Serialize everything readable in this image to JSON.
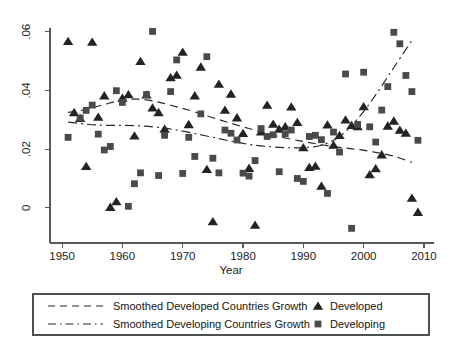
{
  "chart_data": {
    "type": "scatter",
    "title": "",
    "xlabel": "Year",
    "ylabel": "",
    "xlim": [
      1948,
      2011
    ],
    "ylim": [
      -0.012,
      0.064
    ],
    "xticks": [
      1950,
      1960,
      1970,
      1980,
      1990,
      2000,
      2010
    ],
    "xtick_labels": [
      "1950",
      "1960",
      "1970",
      "1980",
      "1990",
      "2000",
      "2010"
    ],
    "yticks": [
      0,
      0.02,
      0.04,
      0.06
    ],
    "ytick_labels": [
      "0",
      ".02",
      ".04",
      ".06"
    ],
    "grid": false,
    "legend_position": "below-axes",
    "series": [
      {
        "name": "Developed",
        "marker": "triangle",
        "color": "#232323",
        "points": [
          [
            1951,
            0.0567
          ],
          [
            1952,
            0.0325
          ],
          [
            1953,
            0.0305
          ],
          [
            1954,
            0.0141
          ],
          [
            1955,
            0.0565
          ],
          [
            1956,
            0.0309
          ],
          [
            1957,
            0.0382
          ],
          [
            1958,
            0.0002
          ],
          [
            1959,
            0.0021
          ],
          [
            1960,
            0.0374
          ],
          [
            1961,
            0.0386
          ],
          [
            1962,
            0.0245
          ],
          [
            1963,
            0.0499
          ],
          [
            1964,
            0.0385
          ],
          [
            1965,
            0.0341
          ],
          [
            1966,
            0.0325
          ],
          [
            1967,
            0.0268
          ],
          [
            1968,
            0.0444
          ],
          [
            1969,
            0.0452
          ],
          [
            1970,
            0.0531
          ],
          [
            1971,
            0.0284
          ],
          [
            1972,
            0.0382
          ],
          [
            1973,
            0.048
          ],
          [
            1974,
            0.0131
          ],
          [
            1975,
            -0.0047
          ],
          [
            1976,
            0.0422
          ],
          [
            1977,
            0.0333
          ],
          [
            1978,
            0.0388
          ],
          [
            1979,
            0.0307
          ],
          [
            1980,
            0.0254
          ],
          [
            1981,
            0.0135
          ],
          [
            1982,
            -0.0059
          ],
          [
            1983,
            0.0259
          ],
          [
            1984,
            0.035
          ],
          [
            1985,
            0.0285
          ],
          [
            1986,
            0.0268
          ],
          [
            1987,
            0.0277
          ],
          [
            1988,
            0.0344
          ],
          [
            1989,
            0.0291
          ],
          [
            1990,
            0.0205
          ],
          [
            1991,
            0.0138
          ],
          [
            1992,
            0.0142
          ],
          [
            1993,
            0.0074
          ],
          [
            1994,
            0.0283
          ],
          [
            1995,
            0.0214
          ],
          [
            1996,
            0.0247
          ],
          [
            1997,
            0.03
          ],
          [
            1998,
            0.0281
          ],
          [
            1999,
            0.0277
          ],
          [
            2000,
            0.0345
          ],
          [
            2001,
            0.0113
          ],
          [
            2002,
            0.0134
          ],
          [
            2003,
            0.0181
          ],
          [
            2004,
            0.0279
          ],
          [
            2005,
            0.0296
          ],
          [
            2006,
            0.0265
          ],
          [
            2007,
            0.0255
          ],
          [
            2008,
            0.0033
          ],
          [
            2009,
            -0.0015
          ]
        ]
      },
      {
        "name": "Developing",
        "marker": "square",
        "color": "#4a4a4a",
        "points": [
          [
            1951,
            0.024
          ],
          [
            1953,
            0.0306
          ],
          [
            1954,
            0.0332
          ],
          [
            1955,
            0.035
          ],
          [
            1956,
            0.0251
          ],
          [
            1957,
            0.0197
          ],
          [
            1958,
            0.0209
          ],
          [
            1959,
            0.0399
          ],
          [
            1960,
            0.0359
          ],
          [
            1961,
            0.0005
          ],
          [
            1962,
            0.0082
          ],
          [
            1963,
            0.0119
          ],
          [
            1964,
            0.0386
          ],
          [
            1965,
            0.0601
          ],
          [
            1966,
            0.011
          ],
          [
            1967,
            0.0247
          ],
          [
            1968,
            0.0396
          ],
          [
            1969,
            0.0504
          ],
          [
            1970,
            0.0117
          ],
          [
            1971,
            0.024
          ],
          [
            1972,
            0.0175
          ],
          [
            1973,
            0.032
          ],
          [
            1974,
            0.0515
          ],
          [
            1975,
            0.0169
          ],
          [
            1976,
            0.0119
          ],
          [
            1977,
            0.0265
          ],
          [
            1978,
            0.0254
          ],
          [
            1979,
            0.0231
          ],
          [
            1980,
            0.0118
          ],
          [
            1981,
            0.0108
          ],
          [
            1982,
            0.0161
          ],
          [
            1983,
            0.027
          ],
          [
            1984,
            0.0243
          ],
          [
            1985,
            0.0249
          ],
          [
            1986,
            0.0123
          ],
          [
            1987,
            0.0252
          ],
          [
            1988,
            0.0265
          ],
          [
            1989,
            0.01
          ],
          [
            1990,
            0.009
          ],
          [
            1991,
            0.0243
          ],
          [
            1992,
            0.0247
          ],
          [
            1993,
            0.0232
          ],
          [
            1994,
            0.0049
          ],
          [
            1995,
            0.0258
          ],
          [
            1996,
            0.019
          ],
          [
            1997,
            0.0456
          ],
          [
            1998,
            -0.007
          ],
          [
            1999,
            0.0284
          ],
          [
            2000,
            0.0462
          ],
          [
            2001,
            0.0276
          ],
          [
            2002,
            0.0224
          ],
          [
            2003,
            0.0333
          ],
          [
            2004,
            0.0413
          ],
          [
            2005,
            0.0598
          ],
          [
            2006,
            0.0559
          ],
          [
            2007,
            0.0451
          ],
          [
            2008,
            0.0396
          ],
          [
            2009,
            0.023
          ]
        ]
      }
    ],
    "smoothed_lines": [
      {
        "name": "Smoothed Developed Countries Growth",
        "style": "dashed",
        "points": [
          [
            1951,
            0.0325
          ],
          [
            1954,
            0.0335
          ],
          [
            1957,
            0.0352
          ],
          [
            1960,
            0.0367
          ],
          [
            1963,
            0.037
          ],
          [
            1966,
            0.036
          ],
          [
            1969,
            0.0344
          ],
          [
            1972,
            0.0327
          ],
          [
            1975,
            0.0307
          ],
          [
            1978,
            0.0288
          ],
          [
            1981,
            0.027
          ],
          [
            1984,
            0.0253
          ],
          [
            1987,
            0.0238
          ],
          [
            1990,
            0.0226
          ],
          [
            1993,
            0.0215
          ],
          [
            1996,
            0.0206
          ],
          [
            1999,
            0.0199
          ],
          [
            2002,
            0.0189
          ],
          [
            2005,
            0.0176
          ],
          [
            2008,
            0.0155
          ]
        ]
      },
      {
        "name": "Smoothed Developing Countries Growth",
        "style": "dash-dot",
        "points": [
          [
            1951,
            0.0292
          ],
          [
            1954,
            0.0285
          ],
          [
            1957,
            0.0281
          ],
          [
            1960,
            0.0281
          ],
          [
            1963,
            0.0279
          ],
          [
            1966,
            0.0274
          ],
          [
            1969,
            0.0265
          ],
          [
            1972,
            0.0253
          ],
          [
            1975,
            0.024
          ],
          [
            1978,
            0.0227
          ],
          [
            1981,
            0.0216
          ],
          [
            1984,
            0.0209
          ],
          [
            1987,
            0.0205
          ],
          [
            1990,
            0.0205
          ],
          [
            1993,
            0.0213
          ],
          [
            1996,
            0.0243
          ],
          [
            1999,
            0.0303
          ],
          [
            2002,
            0.0385
          ],
          [
            2005,
            0.0478
          ],
          [
            2008,
            0.057
          ]
        ]
      }
    ],
    "legend": {
      "rows": [
        {
          "line_style": "dashed",
          "line_label": "Smoothed Developed Countries Growth",
          "marker": "triangle",
          "marker_label": "Developed"
        },
        {
          "line_style": "dash-dot",
          "line_label": "Smoothed Developing Countries Growth",
          "marker": "square",
          "marker_label": "Developing"
        }
      ]
    }
  }
}
